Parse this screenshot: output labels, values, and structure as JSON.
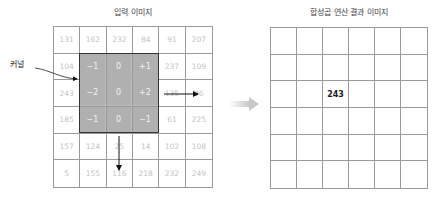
{
  "left_panel": {
    "title": "입력 이미지",
    "grid": [
      [
        "131",
        "162",
        "232",
        "84",
        "91",
        "207"
      ],
      [
        "104",
        "",
        "",
        "",
        "237",
        "109"
      ],
      [
        "243",
        "",
        "",
        "",
        "135",
        "26"
      ],
      [
        "185",
        "",
        "",
        "",
        "61",
        "225"
      ],
      [
        "157",
        "124",
        "25",
        "14",
        "102",
        "108"
      ],
      [
        "5",
        "155",
        "116",
        "218",
        "232",
        "249"
      ]
    ],
    "kernel_label": "커널",
    "kernel": [
      [
        "−1",
        "0",
        "+1"
      ],
      [
        "−2",
        "0",
        "+2"
      ],
      [
        "−1",
        "0",
        "−1"
      ]
    ]
  },
  "right_panel": {
    "title": "합성곱 연산 결과 이미지",
    "grid": [
      [
        "",
        "",
        "",
        "",
        "",
        ""
      ],
      [
        "",
        "",
        "",
        "",
        "",
        ""
      ],
      [
        "",
        "",
        "243",
        "",
        "",
        ""
      ],
      [
        "",
        "",
        "",
        "",
        "",
        ""
      ],
      [
        "",
        "",
        "",
        "",
        "",
        ""
      ],
      [
        "",
        "",
        "",
        "",
        "",
        ""
      ]
    ]
  },
  "colors": {
    "kernel_fill": "#969696",
    "grid_line": "#9a9a9a",
    "input_text": "#c4c4c4",
    "transition_arrow": "#cccccc"
  }
}
